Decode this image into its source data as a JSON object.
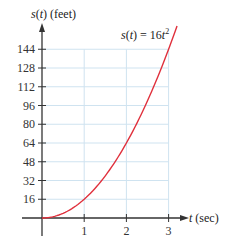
{
  "chart_data": {
    "type": "line",
    "title": "",
    "xlabel": "t (sec)",
    "ylabel": "s(t) (feet)",
    "xlabel_parts": {
      "var": "t",
      "unit": " (sec)"
    },
    "ylabel_parts": {
      "fn": "s",
      "open": "(",
      "var": "t",
      "close": ")",
      "unit": " (feet)"
    },
    "annotation": {
      "text": "s(t) = 16t²",
      "lhs_fn": "s",
      "lhs_var": "t",
      "rhs_coef": "= 16",
      "rhs_var": "t",
      "rhs_exp": "2"
    },
    "xlim": [
      0,
      3
    ],
    "ylim": [
      0,
      144
    ],
    "xticks": [
      1,
      2,
      3
    ],
    "yticks": [
      16,
      32,
      48,
      64,
      80,
      96,
      112,
      128,
      144
    ],
    "grid": true,
    "legend": "none",
    "series": [
      {
        "name": "s(t) = 16t^2",
        "color": "#e0303c",
        "x": [
          0,
          0.25,
          0.5,
          0.75,
          1,
          1.25,
          1.5,
          1.75,
          2,
          2.25,
          2.5,
          2.75,
          3,
          3.2
        ],
        "values": [
          0,
          1,
          4,
          9,
          16,
          25,
          36,
          49,
          64,
          81,
          100,
          121,
          144,
          163.84
        ]
      }
    ]
  },
  "colors": {
    "grid": "#cfe3f0",
    "axis": "#333333",
    "curve": "#e0303c"
  }
}
